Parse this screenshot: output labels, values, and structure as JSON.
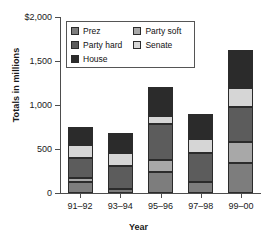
{
  "chart_data": {
    "type": "bar",
    "subtype": "stacked-bar",
    "title": "",
    "xlabel": "Year",
    "ylabel": "Totals in millions",
    "categories": [
      "91–92",
      "93–94",
      "95–96",
      "97–98",
      "99–00"
    ],
    "ylim": [
      0,
      2000
    ],
    "yticks": [
      0,
      500,
      1000,
      1500,
      2000
    ],
    "ytick_labels": [
      "0",
      "500",
      "1,000",
      "1,500",
      "$2,000"
    ],
    "grid": false,
    "legend_position": "upper-left-inside",
    "stack_order_bottom_to_top": [
      "Prez",
      "Party soft",
      "Party hard",
      "Senate",
      "House"
    ],
    "series": [
      {
        "name": "Prez",
        "color": "#7d7d7d",
        "values": [
          130,
          40,
          240,
          120,
          340
        ]
      },
      {
        "name": "Party soft",
        "color": "#a8a8a8",
        "values": [
          35,
          0,
          135,
          0,
          240
        ]
      },
      {
        "name": "Party hard",
        "color": "#5c5c5c",
        "values": [
          235,
          270,
          405,
          330,
          400
        ]
      },
      {
        "name": "Senate",
        "color": "#d6d6d6",
        "values": [
          145,
          140,
          95,
          160,
          210
        ]
      },
      {
        "name": "House",
        "color": "#2b2b2b",
        "values": [
          205,
          235,
          325,
          290,
          430
        ]
      }
    ],
    "totals": [
      750,
      685,
      1200,
      900,
      1620
    ]
  },
  "legend": {
    "entries": [
      {
        "label": "Prez",
        "color": "#7d7d7d"
      },
      {
        "label": "Party hard",
        "color": "#5c5c5c"
      },
      {
        "label": "House",
        "color": "#2b2b2b"
      },
      {
        "label": "Party soft",
        "color": "#a8a8a8"
      },
      {
        "label": "Senate",
        "color": "#d6d6d6"
      }
    ]
  },
  "axes": {
    "y_title": "Totals in millions",
    "x_title": "Year"
  }
}
